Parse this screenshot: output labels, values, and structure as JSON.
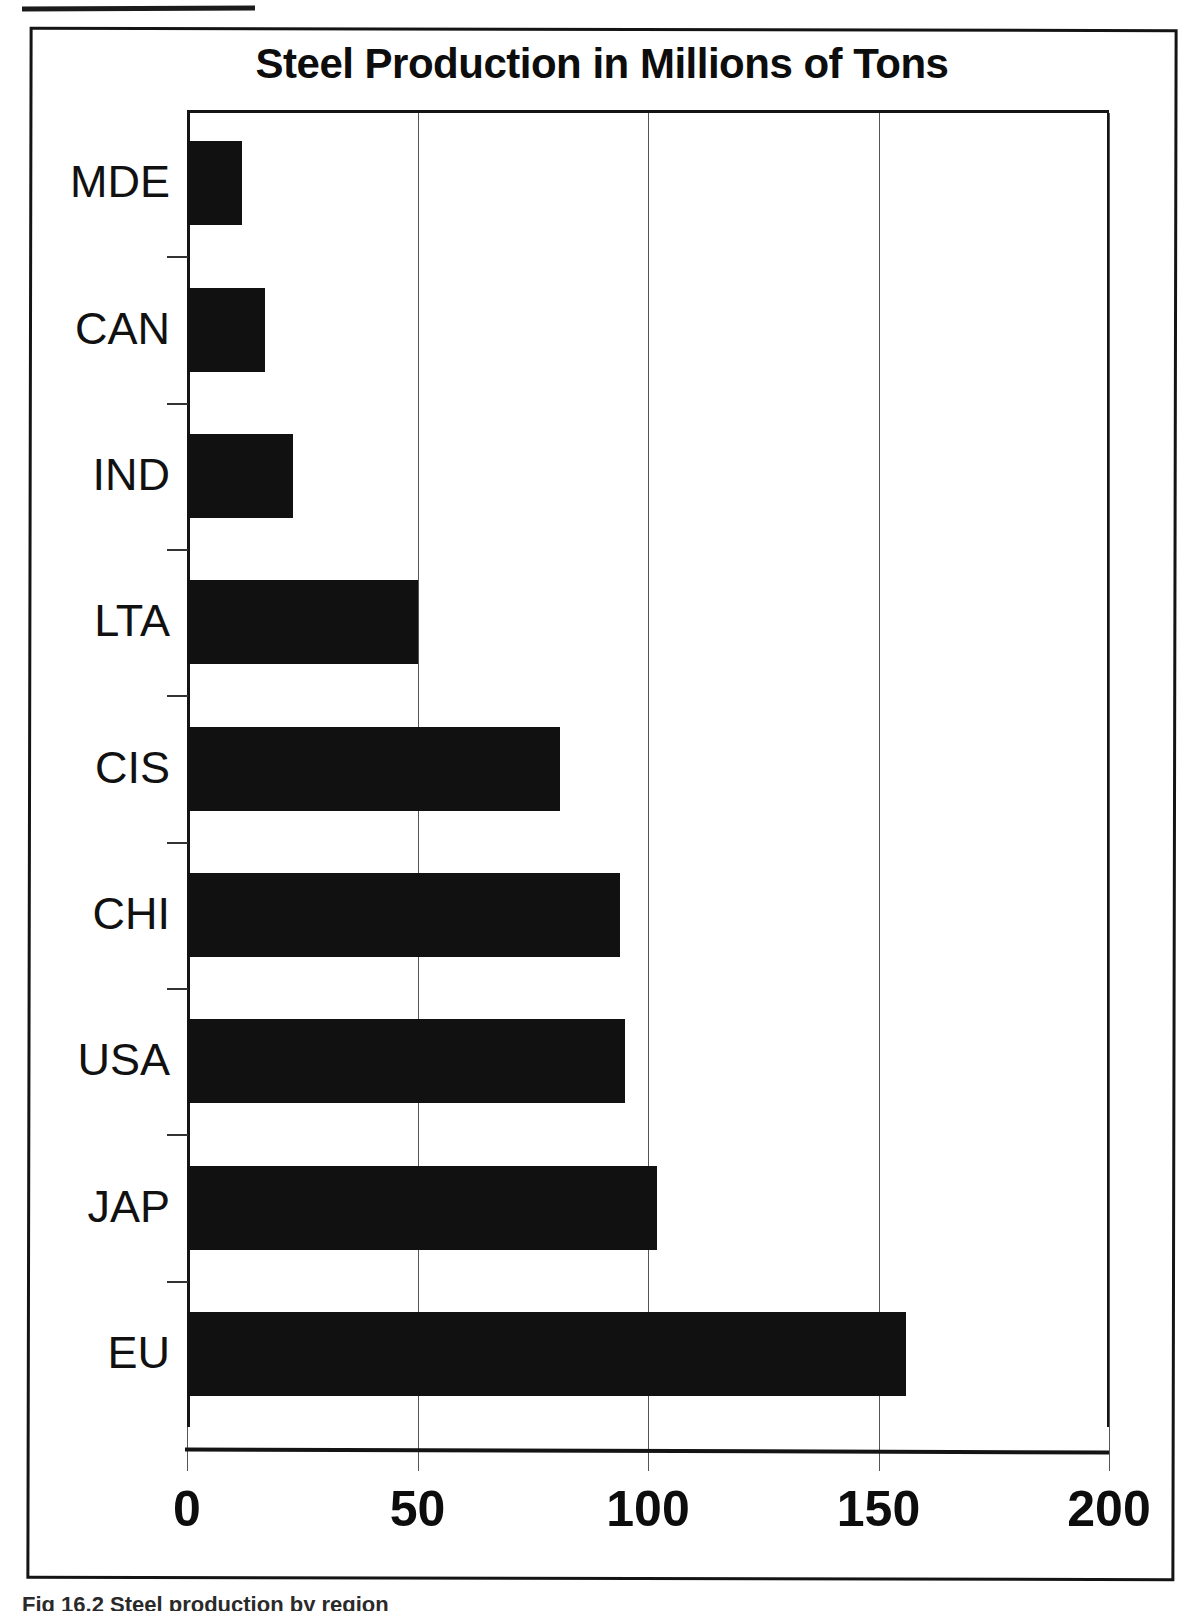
{
  "figure": {
    "title": "Steel Production in Millions of Tons",
    "caption": "Fig 16.2 Steel production by region"
  },
  "chart_data": {
    "type": "bar",
    "orientation": "horizontal",
    "title": "Steel Production in Millions of Tons",
    "xlabel": "",
    "ylabel": "",
    "categories": [
      "MDE",
      "CAN",
      "IND",
      "LTA",
      "CIS",
      "CHI",
      "USA",
      "JAP",
      "EU"
    ],
    "values": [
      12,
      17,
      23,
      50,
      81,
      94,
      95,
      102,
      156
    ],
    "xlim": [
      0,
      200
    ],
    "xticks": [
      0,
      50,
      100,
      150,
      200
    ],
    "xtick_labels": [
      "0",
      "50",
      "100",
      "150",
      "200"
    ],
    "grid": "vertical",
    "legend": "none",
    "bar_color": "#111111",
    "series": [
      {
        "name": "Steel Production",
        "values": [
          12,
          17,
          23,
          50,
          81,
          94,
          95,
          102,
          156
        ]
      }
    ]
  },
  "axis": {
    "ticks": [
      {
        "label": "0",
        "value": 0
      },
      {
        "label": "50",
        "value": 50
      },
      {
        "label": "100",
        "value": 100
      },
      {
        "label": "150",
        "value": 150
      },
      {
        "label": "200",
        "value": 200
      }
    ]
  },
  "bars": [
    {
      "label": "MDE",
      "value": 12
    },
    {
      "label": "CAN",
      "value": 17
    },
    {
      "label": "IND",
      "value": 23
    },
    {
      "label": "LTA",
      "value": 50
    },
    {
      "label": "CIS",
      "value": 81
    },
    {
      "label": "CHI",
      "value": 94
    },
    {
      "label": "USA",
      "value": 95
    },
    {
      "label": "JAP",
      "value": 102
    },
    {
      "label": "EU",
      "value": 156
    }
  ]
}
